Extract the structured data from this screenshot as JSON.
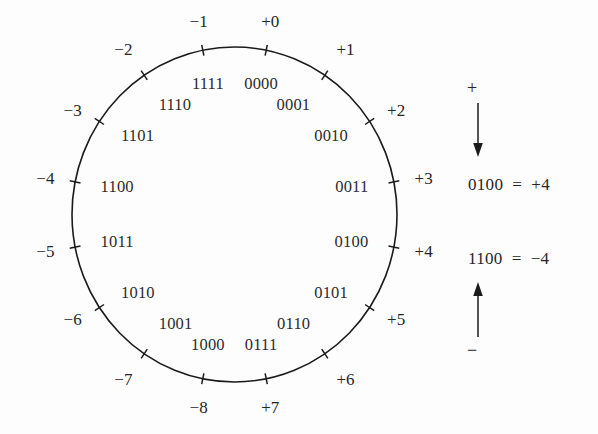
{
  "figure": {
    "circle": {
      "center_x": 234.5,
      "center_y": 214.5,
      "radius_x": 162.5,
      "radius_y": 167.5,
      "stroke": "#1b1b1b",
      "stroke_width": 1.6
    },
    "tick_length": 11,
    "tick_stroke": "#1b1b1b"
  },
  "chart_data": {
    "type": "scatter",
    "xlabel": "",
    "ylabel": "",
    "grid": false,
    "legend_position": "right",
    "categories": [
      "0000",
      "0001",
      "0010",
      "0011",
      "0100",
      "0101",
      "0110",
      "0111",
      "1000",
      "1001",
      "1010",
      "1011",
      "1100",
      "1101",
      "1110",
      "1111"
    ],
    "values": [
      0,
      1,
      2,
      3,
      4,
      5,
      6,
      7,
      -8,
      -7,
      -6,
      -5,
      -4,
      -3,
      -2,
      -1
    ],
    "series": [
      {
        "name": "two's complement mapping",
        "values": [
          0,
          1,
          2,
          3,
          4,
          5,
          6,
          7,
          -8,
          -7,
          -6,
          -5,
          -4,
          -3,
          -2,
          -1
        ]
      }
    ]
  },
  "nodes": [
    {
      "binary": "0000",
      "decimal": "+0",
      "angle_deg": 11.25,
      "dec_side": "out",
      "bin_side": "in"
    },
    {
      "binary": "0001",
      "decimal": "+1",
      "angle_deg": 33.75,
      "dec_side": "out",
      "bin_side": "in"
    },
    {
      "binary": "0010",
      "decimal": "+2",
      "angle_deg": 56.25,
      "dec_side": "out",
      "bin_side": "in"
    },
    {
      "binary": "0011",
      "decimal": "+3",
      "angle_deg": 78.75,
      "dec_side": "out",
      "bin_side": "in"
    },
    {
      "binary": "0100",
      "decimal": "+4",
      "angle_deg": 101.25,
      "dec_side": "out",
      "bin_side": "in"
    },
    {
      "binary": "0101",
      "decimal": "+5",
      "angle_deg": 123.75,
      "dec_side": "out",
      "bin_side": "in"
    },
    {
      "binary": "0110",
      "decimal": "+6",
      "angle_deg": 146.25,
      "dec_side": "out",
      "bin_side": "in"
    },
    {
      "binary": "0111",
      "decimal": "+7",
      "angle_deg": 168.75,
      "dec_side": "out",
      "bin_side": "in"
    },
    {
      "binary": "1000",
      "decimal": "−8",
      "angle_deg": 191.25,
      "dec_side": "out",
      "bin_side": "in"
    },
    {
      "binary": "1001",
      "decimal": "−7",
      "angle_deg": 213.75,
      "dec_side": "out",
      "bin_side": "in"
    },
    {
      "binary": "1010",
      "decimal": "−6",
      "angle_deg": 236.25,
      "dec_side": "out",
      "bin_side": "in"
    },
    {
      "binary": "1011",
      "decimal": "−5",
      "angle_deg": 258.75,
      "dec_side": "out",
      "bin_side": "in"
    },
    {
      "binary": "1100",
      "decimal": "−4",
      "angle_deg": 281.25,
      "dec_side": "out",
      "bin_side": "in"
    },
    {
      "binary": "1101",
      "decimal": "−3",
      "angle_deg": 303.75,
      "dec_side": "out",
      "bin_side": "in"
    },
    {
      "binary": "1110",
      "decimal": "−2",
      "angle_deg": 326.25,
      "dec_side": "out",
      "bin_side": "in"
    },
    {
      "binary": "1111",
      "decimal": "−1",
      "angle_deg": 348.75,
      "dec_side": "out",
      "bin_side": "in"
    }
  ],
  "legend": {
    "positive": {
      "sign": "+",
      "arrow": "down-arrow-icon",
      "equation": "0100  =  +4"
    },
    "negative": {
      "sign": "−",
      "arrow": "up-arrow-icon",
      "equation": "1100  =  −4"
    }
  }
}
